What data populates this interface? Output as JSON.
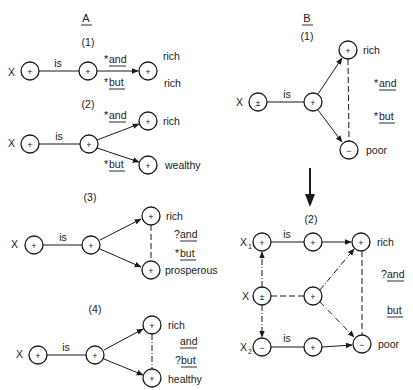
{
  "panels": {
    "A": {
      "title": "A",
      "diagrams": [
        {
          "number": "(1)",
          "subject": "X",
          "copula": "is",
          "nodes": [
            "+",
            "+",
            "+"
          ],
          "labels": [
            "rich",
            "rich"
          ],
          "connectives": [
            {
              "mark": "*",
              "word": "and"
            },
            {
              "mark": "*",
              "word": "but"
            }
          ]
        },
        {
          "number": "(2)",
          "subject": "X",
          "copula": "is",
          "nodes": [
            "+",
            "+",
            "+",
            "+"
          ],
          "labels": [
            "rich",
            "wealthy"
          ],
          "connectives": [
            {
              "mark": "*",
              "word": "and"
            },
            {
              "mark": "*",
              "word": "but"
            }
          ]
        },
        {
          "number": "(3)",
          "subject": "X",
          "copula": "is",
          "nodes": [
            "+",
            "+",
            "+",
            "+"
          ],
          "labels": [
            "rich",
            "prosperous"
          ],
          "connectives": [
            {
              "mark": "?",
              "word": "and"
            },
            {
              "mark": "*",
              "word": "but"
            }
          ]
        },
        {
          "number": "(4)",
          "subject": "X",
          "copula": "is",
          "nodes": [
            "+",
            "+",
            "+",
            "+"
          ],
          "labels": [
            "rich",
            "healthy"
          ],
          "connectives": [
            {
              "mark": "",
              "word": "and"
            },
            {
              "mark": "?",
              "word": "but"
            }
          ]
        }
      ]
    },
    "B": {
      "title": "B",
      "diagrams": [
        {
          "number": "(1)",
          "subject": "X",
          "copula": "is",
          "nodes": [
            "±",
            "+",
            "+",
            "−"
          ],
          "labels": [
            "rich",
            "poor"
          ],
          "connectives": [
            {
              "mark": "*",
              "word": "and"
            },
            {
              "mark": "*",
              "word": "but"
            }
          ]
        },
        {
          "number": "(2)",
          "subjects": {
            "top": "X",
            "top_sub": "1",
            "mid": "X",
            "bottom": "X",
            "bottom_sub": "2"
          },
          "copula": "is",
          "nodes": {
            "x1": "+",
            "x": "±",
            "x2": "−",
            "is_top": "+",
            "mid": "+",
            "is_bottom": "+",
            "rich": "+",
            "poor": "−"
          },
          "labels": [
            "rich",
            "poor"
          ],
          "connectives": [
            {
              "mark": "?",
              "word": "and"
            },
            {
              "mark": "",
              "word": "but"
            }
          ]
        }
      ]
    }
  }
}
